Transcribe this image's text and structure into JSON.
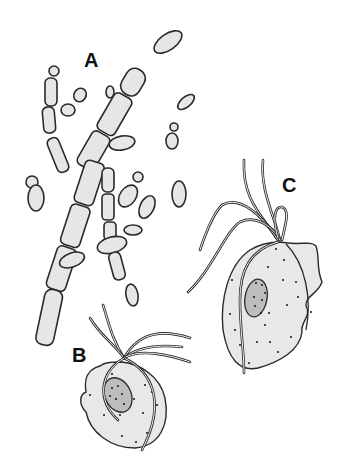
{
  "figure": {
    "labels": [
      {
        "id": "A",
        "text": "A",
        "x": 84,
        "y": 50
      },
      {
        "id": "B",
        "text": "B",
        "x": 72,
        "y": 345
      },
      {
        "id": "C",
        "text": "C",
        "x": 282,
        "y": 175
      }
    ],
    "colors": {
      "background": "#ffffff",
      "cell_fill": "#e6e6e6",
      "outline": "#2a2a2a",
      "nucleus_fill": "#bdbdbd"
    }
  }
}
